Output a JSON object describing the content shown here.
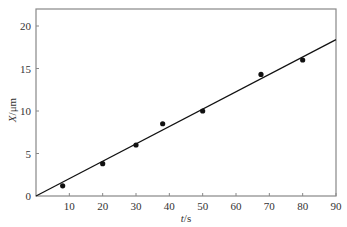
{
  "chart_data": {
    "type": "scatter",
    "title": "",
    "xlabel": "t/s",
    "ylabel": "X/μm",
    "xlim": [
      0,
      90
    ],
    "ylim": [
      0,
      22
    ],
    "xticks": [
      10,
      20,
      30,
      40,
      50,
      60,
      70,
      80,
      90
    ],
    "yticks": [
      0,
      5,
      10,
      15,
      20
    ],
    "grid": false,
    "legend": null,
    "series": [
      {
        "name": "measured",
        "type": "scatter",
        "marker": "filled-circle",
        "color": "#111111",
        "x": [
          8,
          20,
          30,
          38,
          50,
          67.5,
          80
        ],
        "y": [
          1.2,
          3.8,
          6.0,
          8.5,
          10.0,
          14.3,
          16.0
        ]
      },
      {
        "name": "linear-fit",
        "type": "line",
        "color": "#111111",
        "x": [
          0,
          90
        ],
        "y": [
          0,
          18.4
        ]
      }
    ]
  },
  "labels": {
    "x_axis_italic": "t",
    "x_axis_unit": "/s",
    "y_axis_italic": "X",
    "y_axis_unit": "/μm",
    "zero_label": "0"
  },
  "colors": {
    "frame": "#888888",
    "data": "#111111",
    "text": "#333333"
  }
}
